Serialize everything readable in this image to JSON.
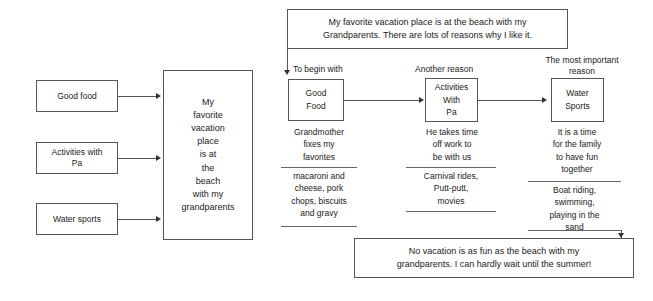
{
  "diagram": {
    "title_text": "Vacation essay planning graphic organizer",
    "topic_box": {
      "line1": "My favorite vacation place is at the beach with my",
      "line2": "Grandparents. There are lots of reasons why I like it."
    },
    "conclusion_box": {
      "line1": "No vacation is as fun as the beach with my",
      "line2": "grandparents. I can hardly wait until the summer!"
    },
    "inputs": [
      {
        "label": "Good food"
      },
      {
        "label": "Activities with\nPa"
      },
      {
        "label": "Water sports"
      }
    ],
    "inputs_flat": {
      "good_food": "Good food",
      "activities": "Activities with",
      "activities_2": "Pa",
      "water_sports": "Water sports"
    },
    "center_box": {
      "l1": "My",
      "l2": "favorite",
      "l3": "vacation",
      "l4": "place",
      "l5": "is at",
      "l6": "the",
      "l7": "beach",
      "l8": "with my",
      "l9": "grandparents"
    },
    "columns": [
      {
        "transition": "To begin with",
        "box_line1": "Good",
        "box_line2": "Food",
        "detail_line1": "Grandmother",
        "detail_line2": "fixes my",
        "detail_line3": "favorites",
        "example_line1": "macaroni and",
        "example_line2": "cheese, pork",
        "example_line3": "chops, biscuits",
        "example_line4": "and gravy"
      },
      {
        "transition": "Another reason",
        "box_line1": "Activities",
        "box_line2": "With",
        "box_line3": "Pa",
        "detail_line1": "He takes time",
        "detail_line2": "off work to",
        "detail_line3": "be with us",
        "example_line1": "Carnival rides,",
        "example_line2": "Putt-putt,",
        "example_line3": "movies"
      },
      {
        "transition_line1": "The most important",
        "transition_line2": "reason",
        "box_line1": "Water",
        "box_line2": "Sports",
        "detail_line1": "It is a time",
        "detail_line2": "for the family",
        "detail_line3": "to have fun",
        "detail_line4": "together",
        "example_line1": "Boat riding,",
        "example_line2": "swimming,",
        "example_line3": "playing in the",
        "example_line4": "sand"
      }
    ],
    "colors": {
      "stroke": "#555555",
      "text": "#1a1a1a",
      "background": "#ffffff"
    }
  }
}
